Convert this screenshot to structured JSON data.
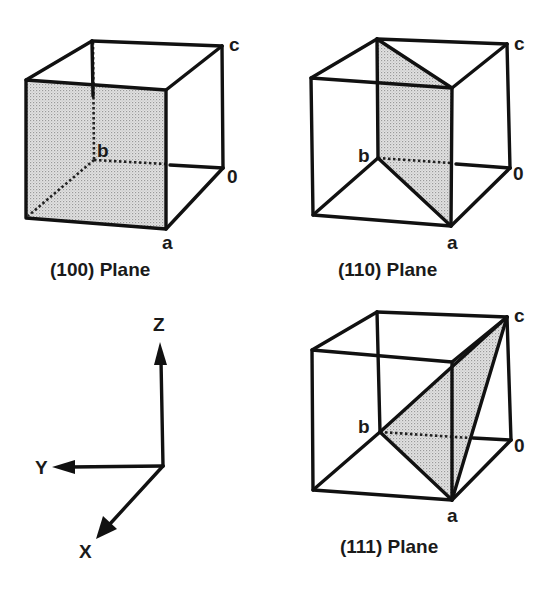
{
  "figure": {
    "panels": [
      {
        "caption": "(100) Plane",
        "plane_indices": "100",
        "vertex_labels": {
          "origin": "0",
          "a": "a",
          "b": "b",
          "c": "c"
        }
      },
      {
        "caption": "(110) Plane",
        "plane_indices": "110",
        "vertex_labels": {
          "origin": "0",
          "a": "a",
          "b": "b",
          "c": "c"
        }
      },
      {
        "caption": "(111) Plane",
        "plane_indices": "111",
        "vertex_labels": {
          "origin": "0",
          "a": "a",
          "b": "b",
          "c": "c"
        }
      }
    ],
    "axes": {
      "x_label": "X",
      "y_label": "Y",
      "z_label": "Z"
    },
    "colors": {
      "line": "#111111",
      "shade": "#c8c8c8",
      "background": "#ffffff"
    }
  }
}
